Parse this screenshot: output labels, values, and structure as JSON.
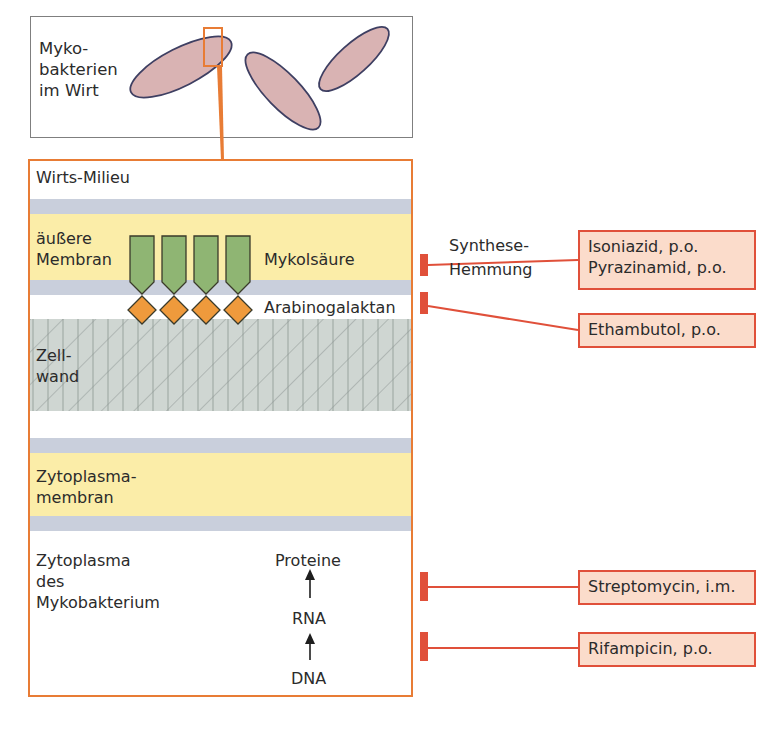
{
  "host_panel": {
    "label": "Myko-\nbakterien\nim Wirt"
  },
  "cell_panel": {
    "environment_label": "Wirts-Milieu",
    "outer_membrane_label": "äußere\nMembran",
    "mycolic_acid_label": "Mykolsäure",
    "arabinogalactan_label": "Arabinogalaktan",
    "cell_wall_label": "Zell-\nwand",
    "cytoplasmic_membrane_label": "Zytoplasma-\nmembran",
    "cytoplasm_label": "Zytoplasma\ndes\nMykobakterium",
    "central_dogma": {
      "protein": "Proteine",
      "rna": "RNA",
      "dna": "DNA"
    }
  },
  "inhibition": {
    "synthesis_label": "Synthese-\nHemmung"
  },
  "drugs": [
    {
      "label": "Isoniazid, p.o.\nPyrazinamid, p.o.",
      "target": "Mykolsäure"
    },
    {
      "label": "Ethambutol, p.o.",
      "target": "Arabinogalaktan"
    },
    {
      "label": "Streptomycin, i.m.",
      "target": "Proteine"
    },
    {
      "label": "Rifampicin, p.o.",
      "target": "RNA"
    }
  ],
  "colors": {
    "accent_orange": "#e87c35",
    "inhibitor_red": "#e0503a",
    "drug_box_fill": "#fbdccb",
    "membrane_yellow": "#fbeda8",
    "membrane_blue": "#c9cfdc",
    "mycolic_green": "#8fb573",
    "arabinogalactan_orange": "#ef9a3c",
    "bacterium_fill": "#d9b3b3",
    "bacterium_stroke": "#3e3f62"
  }
}
